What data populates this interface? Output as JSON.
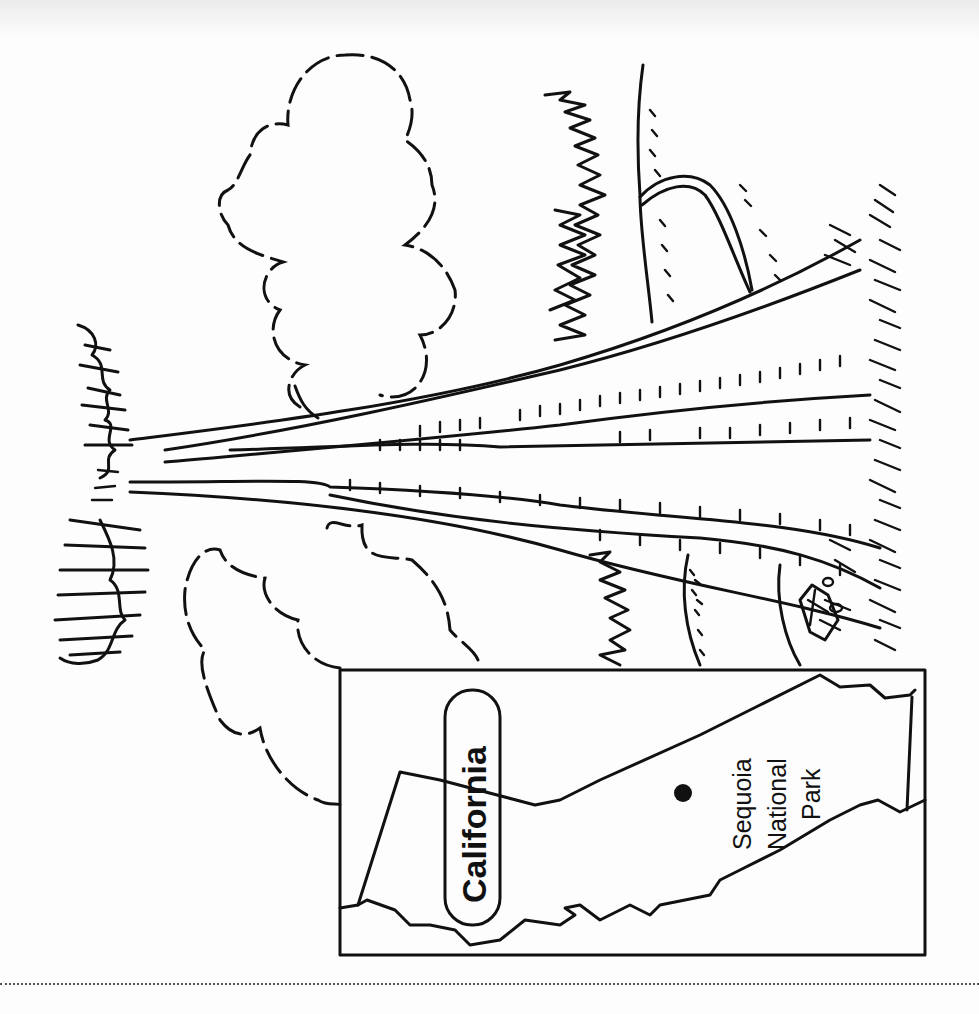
{
  "illustration": {
    "subject": "giant sequoia tree with road, clouds and small trees",
    "orientation": "rotated 90 degrees clockwise",
    "colors": {
      "ink": "#111111",
      "paper": "#fdfdfd",
      "cut_line": "#555555"
    }
  },
  "inset_map": {
    "state_label": "California",
    "location_marker": "dot",
    "location_label_lines": [
      "Sequoia",
      "National",
      "Park"
    ]
  },
  "cut_line": {
    "style": "dotted"
  }
}
